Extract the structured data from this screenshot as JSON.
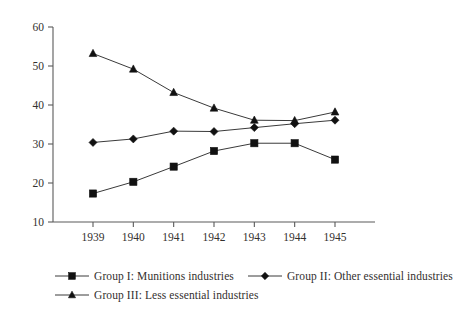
{
  "chart_data": {
    "type": "line",
    "title": "",
    "subtitle": "",
    "xlabel": "",
    "ylabel": "",
    "categories": [
      "1939",
      "1940",
      "1941",
      "1942",
      "1943",
      "1944",
      "1945"
    ],
    "x": [
      1939,
      1940,
      1941,
      1942,
      1943,
      1944,
      1945
    ],
    "xlim": [
      1939,
      1945
    ],
    "ylim": [
      10,
      60
    ],
    "yticks": [
      10,
      20,
      30,
      40,
      50,
      60
    ],
    "ytick_labels": [
      "10",
      "20",
      "30",
      "40",
      "50",
      "60"
    ],
    "xticks": [
      1939,
      1940,
      1941,
      1942,
      1943,
      1944,
      1945
    ],
    "xtick_labels": [
      "1939",
      "1940",
      "1941",
      "1942",
      "1943",
      "1944",
      "1945"
    ],
    "grid": false,
    "legend_position": "bottom",
    "series": [
      {
        "name": "Group I: Munitions industries",
        "marker": "square",
        "color": "#111111",
        "values": [
          17.3,
          20.3,
          24.2,
          28.2,
          30.2,
          30.2,
          26.0
        ]
      },
      {
        "name": "Group II: Other essential industries",
        "marker": "diamond",
        "color": "#111111",
        "values": [
          30.4,
          31.3,
          33.3,
          33.2,
          34.2,
          35.2,
          36.1
        ]
      },
      {
        "name": "Group III: Less essential industries",
        "marker": "triangle",
        "color": "#111111",
        "values": [
          53.2,
          49.2,
          43.2,
          39.2,
          36.1,
          36.0,
          38.2
        ]
      }
    ]
  },
  "legend": {
    "rows": [
      [
        {
          "label": "Group I: Munitions industries",
          "marker": "square-marker-icon"
        },
        {
          "label": "Group II: Other essential industries",
          "marker": "diamond-marker-icon"
        }
      ],
      [
        {
          "label": "Group III: Less essential industries",
          "marker": "triangle-marker-icon"
        }
      ]
    ]
  },
  "axes": {
    "y_labels": [
      "60",
      "50",
      "40",
      "30",
      "20",
      "10"
    ],
    "x_labels": [
      "1939",
      "1940",
      "1941",
      "1942",
      "1943",
      "1944",
      "1945"
    ]
  },
  "colors": {
    "ink": "#111111",
    "axis": "#5a5a5a",
    "text": "#33302e",
    "background": "#ffffff"
  }
}
